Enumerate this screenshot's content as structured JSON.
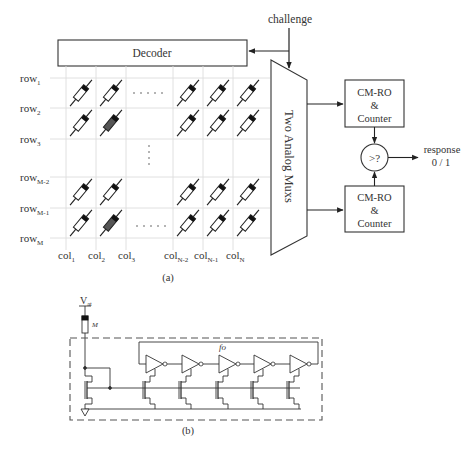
{
  "figure_a": {
    "caption": "(a)",
    "challenge_label": "challenge",
    "decoder_label": "Decoder",
    "mux_label": "Two Analog Muxs",
    "counter_top": {
      "line1": "CM-RO",
      "line2": "&",
      "line3": "Counter"
    },
    "counter_bottom": {
      "line1": "CM-RO",
      "line2": "&",
      "line3": "Counter"
    },
    "comparator_label": ">?",
    "response_label": "response",
    "response_values": "0 / 1",
    "rows": [
      {
        "base": "row",
        "sub": "1"
      },
      {
        "base": "row",
        "sub": "2"
      },
      {
        "base": "row",
        "sub": "3"
      },
      {
        "base": "row",
        "sub": "M-2"
      },
      {
        "base": "row",
        "sub": "M-1"
      },
      {
        "base": "row",
        "sub": "M"
      }
    ],
    "cols": [
      {
        "base": "col",
        "sub": "1"
      },
      {
        "base": "col",
        "sub": "2"
      },
      {
        "base": "col",
        "sub": "3"
      },
      {
        "base": "col",
        "sub": "N-2"
      },
      {
        "base": "col",
        "sub": "N-1"
      },
      {
        "base": "col",
        "sub": "N"
      }
    ],
    "horizontal_ellipsis": ". . . . .",
    "vertical_ellipsis": ".",
    "selected_cells": [
      "row2-col2",
      "rowM-col2"
    ],
    "colors": {
      "selected_cell_fill": "#555555",
      "grid_line": "#dddddd",
      "stroke": "#333333"
    }
  },
  "figure_b": {
    "caption": "(b)",
    "supply_label": {
      "base": "V",
      "sub": "at"
    },
    "device_label": "M",
    "oscillator_label": "fo",
    "inverter_count": 5
  }
}
